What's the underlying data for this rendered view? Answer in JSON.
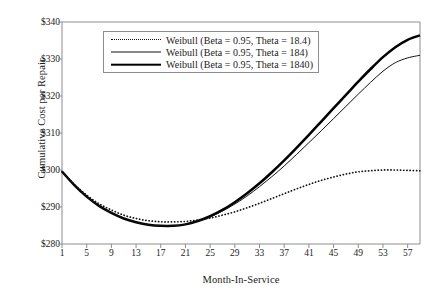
{
  "chart_data": {
    "type": "line",
    "title": "",
    "xlabel": "Month-In-Service",
    "ylabel": "Cumulative Cost per Repair",
    "xlim": [
      1,
      59
    ],
    "ylim": [
      280,
      340
    ],
    "grid": false,
    "legend_position": "top-left-inside",
    "x_ticks": [
      "1",
      "5",
      "9",
      "13",
      "17",
      "21",
      "25",
      "29",
      "33",
      "37",
      "41",
      "45",
      "49",
      "53",
      "57"
    ],
    "y_ticks": [
      "$280",
      "$290",
      "$300",
      "$310",
      "$320",
      "$330",
      "$340"
    ],
    "x": [
      1,
      3,
      5,
      7,
      9,
      11,
      13,
      15,
      17,
      19,
      21,
      23,
      25,
      27,
      29,
      31,
      33,
      35,
      37,
      39,
      41,
      43,
      45,
      47,
      49,
      51,
      53,
      55,
      57,
      59
    ],
    "series": [
      {
        "name": "Weibull (Beta = 0.95, Theta = 18.4)",
        "style": "dotted",
        "values": [
          299.6,
          296.1,
          293.2,
          290.9,
          289.2,
          287.8,
          286.9,
          286.3,
          286.0,
          286.0,
          286.1,
          286.5,
          287.0,
          287.8,
          288.7,
          289.8,
          291.0,
          292.3,
          293.6,
          294.9,
          296.1,
          297.2,
          298.1,
          298.9,
          299.5,
          299.8,
          300.0,
          300.0,
          299.9,
          299.8
        ]
      },
      {
        "name": "Weibull (Beta = 0.95, Theta = 184)",
        "style": "thin",
        "values": [
          299.6,
          295.9,
          292.8,
          290.3,
          288.4,
          286.9,
          285.9,
          285.2,
          284.9,
          284.9,
          285.3,
          286.1,
          287.3,
          288.9,
          290.8,
          293.0,
          295.5,
          298.2,
          301.1,
          304.2,
          307.4,
          310.6,
          313.9,
          317.2,
          320.5,
          323.7,
          326.7,
          329.0,
          330.3,
          331.0
        ]
      },
      {
        "name": "Weibull (Beta = 0.95, Theta = 1840)",
        "style": "thick",
        "values": [
          299.6,
          295.9,
          292.8,
          290.3,
          288.4,
          286.9,
          285.9,
          285.2,
          284.9,
          284.9,
          285.3,
          286.2,
          287.5,
          289.2,
          291.3,
          293.7,
          296.4,
          299.4,
          302.6,
          306.0,
          309.5,
          313.1,
          316.7,
          320.3,
          323.9,
          327.3,
          330.5,
          333.2,
          335.2,
          336.4
        ]
      }
    ],
    "colors": {
      "line_dark": "#111111",
      "line_black": "#000000",
      "axis": "#8d8d8d",
      "background": "#ffffff"
    }
  },
  "legend": {
    "items": [
      {
        "label": "Weibull (Beta = 0.95, Theta = 18.4)",
        "style": "dotted"
      },
      {
        "label": "Weibull (Beta = 0.95, Theta = 184)",
        "style": "thin"
      },
      {
        "label": "Weibull (Beta = 0.95, Theta = 1840)",
        "style": "thick"
      }
    ]
  }
}
